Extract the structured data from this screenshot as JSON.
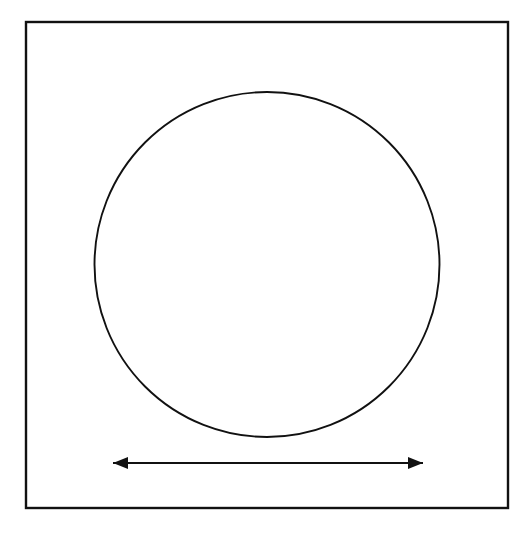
{
  "figure": {
    "title": "",
    "caption": "",
    "background_color": "#ffffff",
    "stroke_color": "#111111",
    "canvas": {
      "width": 519,
      "height": 533
    }
  },
  "shapes": {
    "boundary_square": {
      "name": "boundary-square",
      "label": "",
      "x": 26,
      "y": 22,
      "width": 482,
      "height": 486,
      "stroke_width": 2.4,
      "fill": "none",
      "stroke": "#111111"
    },
    "inscribed_circle": {
      "name": "inscribed-circle",
      "label": "",
      "cx": 267,
      "cy": 264.5,
      "r": 172.5,
      "stroke_width": 1.9,
      "fill": "none",
      "stroke": "#111111"
    },
    "diameter_arrow": {
      "name": "diameter-arrow",
      "label": "",
      "x1": 113,
      "y1": 463,
      "x2": 423,
      "y2": 463,
      "length_px": 310,
      "stroke_width": 2.2,
      "stroke": "#111111",
      "head_length": 15,
      "head_half_width": 6,
      "double_headed": true
    }
  },
  "annotations": {
    "arrow_label": "",
    "square_label": "",
    "circle_label": ""
  }
}
